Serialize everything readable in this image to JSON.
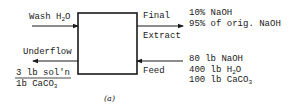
{
  "diagram": {
    "caption": "(a)",
    "process_box": {
      "label": ""
    },
    "streams": {
      "wash_water": {
        "label_main": "Wash H",
        "label_sub": "2",
        "label_tail": "O",
        "direction": "in"
      },
      "underflow": {
        "label": "Underflow",
        "direction": "out",
        "spec_numerator": "3 lb sol'n",
        "spec_denominator_main": "1b CaCO",
        "spec_denominator_sub": "3"
      },
      "final_extract": {
        "label_line1": "Final",
        "label_line2": "Extract",
        "direction": "out",
        "composition": [
          "10% NaOH",
          "95% of orig. NaOH"
        ]
      },
      "feed": {
        "label": "Feed",
        "direction": "in",
        "composition": {
          "line1": "80 lb NaOH",
          "line2_main": "400 lb H",
          "line2_sub": "2",
          "line2_tail": "O",
          "line3_main": "100 lb CaCO",
          "line3_sub": "3"
        }
      }
    }
  }
}
